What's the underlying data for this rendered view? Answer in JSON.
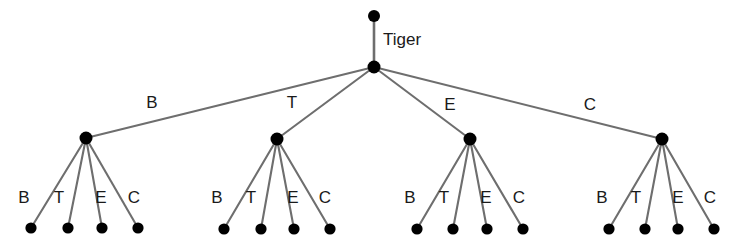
{
  "diagram": {
    "type": "tree",
    "title_visible": false,
    "background_color": "#ffffff",
    "line_color": "#6e6e6e",
    "node_color": "#000000",
    "text_color": "#1a1a1a",
    "root": {
      "name": "Tiger",
      "label_x": 383,
      "label_y": 45,
      "dot": {
        "x": 374,
        "y": 16,
        "r": 6
      }
    },
    "hub": {
      "dot": {
        "x": 374,
        "y": 67,
        "r": 6.5
      }
    },
    "branches": [
      {
        "edge_label": "B",
        "edge_label_x": 152,
        "edge_label_y": 108,
        "node": {
          "x": 86,
          "y": 138,
          "r": 6.5
        },
        "leaves": [
          {
            "label": "B",
            "label_x": 24,
            "label_y": 203,
            "dot_x": 31,
            "dot_y": 228
          },
          {
            "label": "T",
            "label_x": 59,
            "label_y": 203,
            "dot_x": 68,
            "dot_y": 228
          },
          {
            "label": "E",
            "label_x": 101,
            "label_y": 203,
            "dot_x": 102,
            "dot_y": 228
          },
          {
            "label": "C",
            "label_x": 134,
            "label_y": 203,
            "dot_x": 138,
            "dot_y": 228
          }
        ]
      },
      {
        "edge_label": "T",
        "edge_label_x": 292,
        "edge_label_y": 108,
        "node": {
          "x": 277,
          "y": 139,
          "r": 6.5
        },
        "leaves": [
          {
            "label": "B",
            "label_x": 217,
            "label_y": 203,
            "dot_x": 224,
            "dot_y": 229
          },
          {
            "label": "T",
            "label_x": 251,
            "label_y": 203,
            "dot_x": 261,
            "dot_y": 229
          },
          {
            "label": "E",
            "label_x": 293,
            "label_y": 203,
            "dot_x": 294,
            "dot_y": 229
          },
          {
            "label": "C",
            "label_x": 325,
            "label_y": 203,
            "dot_x": 330,
            "dot_y": 229
          }
        ]
      },
      {
        "edge_label": "E",
        "edge_label_x": 450,
        "edge_label_y": 110,
        "node": {
          "x": 470,
          "y": 139,
          "r": 6.5
        },
        "leaves": [
          {
            "label": "B",
            "label_x": 410,
            "label_y": 203,
            "dot_x": 417,
            "dot_y": 229
          },
          {
            "label": "T",
            "label_x": 444,
            "label_y": 203,
            "dot_x": 453,
            "dot_y": 229
          },
          {
            "label": "E",
            "label_x": 486,
            "label_y": 203,
            "dot_x": 487,
            "dot_y": 229
          },
          {
            "label": "C",
            "label_x": 519,
            "label_y": 203,
            "dot_x": 523,
            "dot_y": 229
          }
        ]
      },
      {
        "edge_label": "C",
        "edge_label_x": 590,
        "edge_label_y": 110,
        "node": {
          "x": 662,
          "y": 139,
          "r": 6.5
        },
        "leaves": [
          {
            "label": "B",
            "label_x": 602,
            "label_y": 203,
            "dot_x": 609,
            "dot_y": 229
          },
          {
            "label": "T",
            "label_x": 636,
            "label_y": 203,
            "dot_x": 645,
            "dot_y": 229
          },
          {
            "label": "E",
            "label_x": 678,
            "label_y": 203,
            "dot_x": 678,
            "dot_y": 229
          },
          {
            "label": "C",
            "label_x": 710,
            "label_y": 203,
            "dot_x": 714,
            "dot_y": 229
          }
        ]
      }
    ]
  }
}
